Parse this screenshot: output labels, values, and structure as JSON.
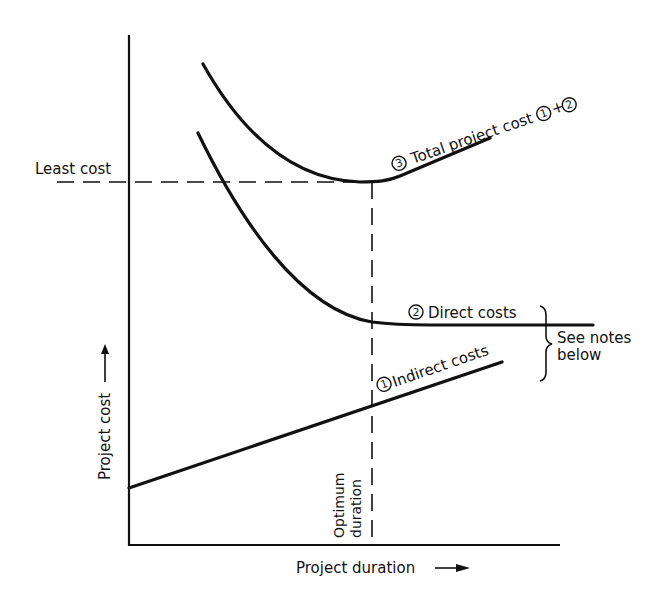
{
  "diagram": {
    "type": "cost-duration tradeoff",
    "axes": {
      "y_label": "Project cost",
      "x_label": "Project duration"
    },
    "reference_lines": {
      "least_cost_label": "Least cost",
      "optimum_duration_line1": "Optimum",
      "optimum_duration_line2": "duration"
    },
    "curves": [
      {
        "id": "indirect",
        "number": "1",
        "label": "Indirect costs"
      },
      {
        "id": "direct",
        "number": "2",
        "label": "Direct costs"
      },
      {
        "id": "total",
        "number": "3",
        "label": "Total project cost",
        "formula_a": "1",
        "formula_plus": "+",
        "formula_b": "2"
      }
    ],
    "note": {
      "line1": "See notes",
      "line2": "below"
    }
  }
}
